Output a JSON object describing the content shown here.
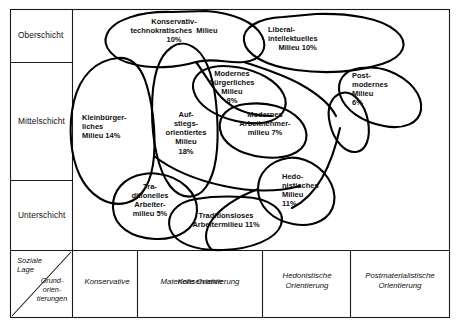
{
  "diagram": {
    "corner": {
      "axis_y_label": "Soziale\nLage",
      "axis_x_label": "Grund-\norien-\ntierungen"
    },
    "strata": [
      {
        "id": "oberschicht",
        "label": "Oberschicht"
      },
      {
        "id": "mittelschicht",
        "label": "Mittelschicht"
      },
      {
        "id": "unterschicht",
        "label": "Unterschicht"
      }
    ],
    "orientations": [
      {
        "id": "konservative",
        "label": "Konservative"
      },
      {
        "id": "materielle",
        "label": "Materielle Orientierung"
      },
      {
        "id": "hedonistische",
        "label": "Hedonistische\nOrientierung"
      },
      {
        "id": "postmaterialistische",
        "label": "Postmaterialistische\nOrientierung"
      }
    ],
    "milieus": [
      {
        "id": "konservativ-technokratisches",
        "name": "Konservativ-\ntechnokratisches  Milieu\n10%",
        "share_percent": 10
      },
      {
        "id": "liberal-intellektuelles",
        "name": "Liberal-\nintellektuelles\n     Milieu 10%",
        "share_percent": 10
      },
      {
        "id": "kleinbuergerliches",
        "name": "Kleinbürger-\nliches\nMilieu 14%",
        "share_percent": 14
      },
      {
        "id": "aufstiegsorientiertes",
        "name": "Auf-\nstiegs-\norientiertes\nMilieu\n18%",
        "share_percent": 18
      },
      {
        "id": "modernes-buergerliches",
        "name": "Modernes\nbürgerliches\nMilieu\n8%",
        "share_percent": 8
      },
      {
        "id": "modernes-arbeitnehmermilieu",
        "name": "Modernes\nArbeitnehmer-\nmilieu 7%",
        "share_percent": 7
      },
      {
        "id": "postmodernes",
        "name": "Post-\nmodernes\nMilieu\n6%",
        "share_percent": 6
      },
      {
        "id": "hedonistisches",
        "name": "Hedo-\nnistisches\nMilieu\n11%",
        "share_percent": 11
      },
      {
        "id": "traditionelles-arbeitermilieu",
        "name": "Tra-\nditionelles\nArbeiter-\nmilieu 5%",
        "share_percent": 5
      },
      {
        "id": "traditionsloses-arbeitermilieu",
        "name": "Traditionsloses\nArbeitermilieu 11%",
        "share_percent": 11
      }
    ],
    "colors": {
      "stroke": "#000000",
      "frame": "#1a1a1a",
      "background": "#ffffff",
      "text": "#111111"
    }
  }
}
